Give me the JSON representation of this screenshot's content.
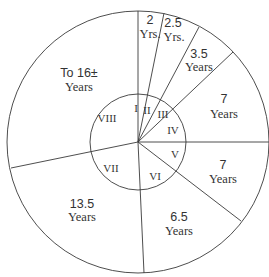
{
  "diagram": {
    "type": "sector-diagram",
    "center": [
      138,
      142
    ],
    "outer_radius": 131,
    "inner_radius": 48,
    "stroke_color": "#3a3a3a",
    "text_color": "#333333",
    "sectors": [
      {
        "roman": "I",
        "value": "2",
        "unit": "Yrs.",
        "years": 2
      },
      {
        "roman": "II",
        "value": "2.5",
        "unit": "Yrs.",
        "years": 2.5
      },
      {
        "roman": "III",
        "value": "3.5",
        "unit": "Years",
        "years": 3.5
      },
      {
        "roman": "IV",
        "value": "7",
        "unit": "Years",
        "years": 7
      },
      {
        "roman": "V",
        "value": "7",
        "unit": "Years",
        "years": 7
      },
      {
        "roman": "VI",
        "value": "6.5",
        "unit": "Years",
        "years": 6.5
      },
      {
        "roman": "VII",
        "value": "13.5",
        "unit": "Years",
        "years": 13.5
      },
      {
        "roman": "VIII",
        "value": "To 16±",
        "unit": "Years",
        "years": 16
      }
    ]
  }
}
